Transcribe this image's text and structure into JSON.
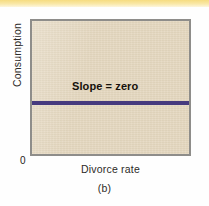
{
  "figure": {
    "panel_label": "(b)",
    "origin_label": "0",
    "top_stripe_color": "#f6dc80",
    "plot_background_color": "#e3d6bd",
    "plot_border_color": "#8e8d8a",
    "line_color": "#463a7e"
  },
  "chart_data": {
    "type": "line",
    "title": "",
    "subtitle": "(b)",
    "xlabel": "Divorce rate",
    "ylabel": "Consumption",
    "annotation": "Slope = zero",
    "annotations": [
      "Slope = zero"
    ],
    "origin_tick": "0",
    "grid": false,
    "legend": false,
    "xlim": [
      0,
      1
    ],
    "ylim": [
      0,
      1
    ],
    "xticks": [],
    "yticks": [],
    "xticklabels": [],
    "yticklabels": [],
    "series": [
      {
        "name": "Slope = zero",
        "color": "#463a7e",
        "x": [
          0,
          1
        ],
        "values": [
          0.4,
          0.4
        ]
      }
    ]
  }
}
